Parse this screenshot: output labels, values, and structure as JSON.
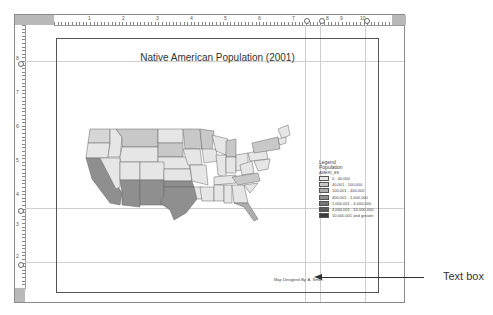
{
  "layout_view": {
    "top_ruler": {
      "labels": [
        "1",
        "2",
        "3",
        "4",
        "5",
        "6",
        "7",
        "8",
        "9",
        "10"
      ]
    },
    "left_ruler": {
      "labels": [
        "8",
        "7",
        "6",
        "5",
        "4",
        "3",
        "2",
        "1"
      ]
    }
  },
  "map": {
    "title": "Native American Population (2001)",
    "credit": "Map Designed By: A. Smith",
    "legend": {
      "heading": "Legend",
      "layer": "Population",
      "field": "AMERI_ES",
      "classes": [
        {
          "label": "0 - 40,000",
          "color": "#e6e6e6"
        },
        {
          "label": "40,001 - 100,000",
          "color": "#c8c8c8"
        },
        {
          "label": "100,001 - 400,000",
          "color": "#adadad"
        },
        {
          "label": "400,001 - 1,000,000",
          "color": "#8f8f8f"
        },
        {
          "label": "1,000,001 - 4,000,000",
          "color": "#767676"
        },
        {
          "label": "4,000,001 - 10,000,000",
          "color": "#5a5a5a"
        },
        {
          "label": "10,000,001 and greater",
          "color": "#3c3c3c"
        }
      ]
    }
  },
  "annotation": {
    "callout": "Text box"
  }
}
